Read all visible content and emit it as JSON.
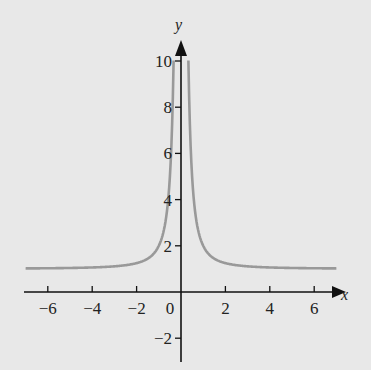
{
  "chart_data": {
    "type": "line",
    "title": "",
    "xlabel": "x",
    "ylabel": "y",
    "function": "y = 1 + 1/x^2",
    "xlim": [
      -7,
      7
    ],
    "ylim": [
      -3,
      10.5
    ],
    "x_ticks": [
      -6,
      -4,
      -2,
      0,
      2,
      4,
      6
    ],
    "y_ticks": [
      -2,
      2,
      4,
      6,
      8,
      10
    ],
    "x_tick_labels": [
      "−6",
      "−4",
      "−2",
      "0",
      "2",
      "4",
      "6"
    ],
    "y_tick_labels": [
      "−2",
      "2",
      "4",
      "6",
      "8",
      "10"
    ],
    "grid": false,
    "legend": null,
    "series": [
      {
        "name": "y = 1 + 1/x^2",
        "color": "#999999",
        "x": [
          -7,
          -6,
          -5,
          -4,
          -3,
          -2,
          -1.5,
          -1,
          -0.75,
          -0.5,
          -0.4,
          -0.33,
          0.33,
          0.4,
          0.5,
          0.75,
          1,
          1.5,
          2,
          3,
          4,
          5,
          6,
          7
        ],
        "y": [
          1.02,
          1.03,
          1.04,
          1.06,
          1.11,
          1.25,
          1.44,
          2.0,
          2.78,
          5.0,
          7.25,
          10.0,
          10.0,
          7.25,
          5.0,
          2.78,
          2.0,
          1.44,
          1.25,
          1.11,
          1.06,
          1.04,
          1.03,
          1.02
        ]
      }
    ],
    "colors": {
      "background": "#e8e8e8",
      "axis": "#111111",
      "curve": "#999999"
    }
  }
}
